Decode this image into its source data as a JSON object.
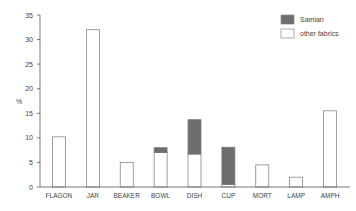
{
  "chart_data": {
    "type": "bar",
    "stacked": true,
    "title": "",
    "xlabel": "",
    "ylabel": "%",
    "ylim": [
      0,
      35
    ],
    "yticks": [
      0,
      5,
      10,
      15,
      20,
      25,
      30,
      35
    ],
    "grid": false,
    "legend_position": "top-right",
    "categories": [
      "FLAGON",
      "JAR",
      "BEAKER",
      "BOWL",
      "DISH",
      "CUP",
      "MORT",
      "LAMP",
      "AMPH"
    ],
    "series": [
      {
        "name": "other fabrics",
        "color": "#ffffff",
        "values": [
          10.2,
          32,
          5,
          7,
          6.7,
          0.5,
          4.5,
          2,
          15.5
        ]
      },
      {
        "name": "Samian",
        "color": "#6e6e6e",
        "values": [
          0,
          0,
          0,
          1,
          7,
          7.6,
          0,
          0,
          0
        ]
      }
    ]
  },
  "legend": {
    "items": [
      {
        "label": "Samian",
        "color": "#6e6e6e"
      },
      {
        "label": "other fabrics",
        "color": "#ffffff"
      }
    ]
  }
}
